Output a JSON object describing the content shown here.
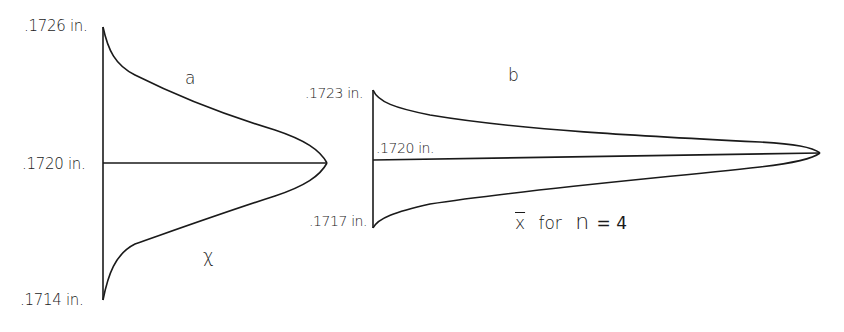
{
  "figure": {
    "panel_a": {
      "letter": "a",
      "variable_label": "χ",
      "tick_labels": {
        "top": ".1726 in.",
        "mid": ".1720 in.",
        "bottom": ".1714 in."
      },
      "range": [
        0.1714,
        0.1726
      ],
      "mean": 0.172
    },
    "panel_b": {
      "letter": "b",
      "caption_xbar": "x",
      "caption_for": "for",
      "caption_n": "n",
      "caption_eq": "= 4",
      "tick_labels": {
        "top": ".1723 in.",
        "mid": ".1720 in.",
        "bottom": ".1717 in."
      },
      "range": [
        0.1717,
        0.1723
      ],
      "mean": 0.172,
      "sample_size": 4
    },
    "line_color": "#1a1a1a",
    "background": "#ffffff"
  }
}
